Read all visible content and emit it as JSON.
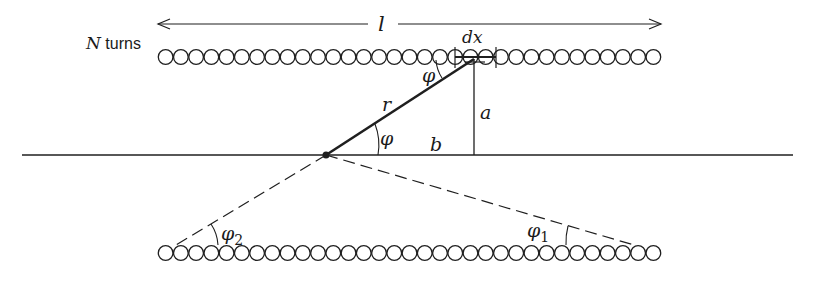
{
  "figure": {
    "labels": {
      "n_turns_symbol": "N",
      "n_turns_text": " turns",
      "length": "l",
      "element": "dx",
      "radius_vector": "r",
      "angle_top": "φ",
      "angle_center": "φ",
      "height": "a",
      "base": "b",
      "angle_left": "φ",
      "angle_left_sub": "2",
      "angle_right": "φ",
      "angle_right_sub": "1"
    },
    "solenoid": {
      "turns_per_row": 33,
      "row_top_y": 57,
      "row_bottom_y": 253,
      "x_start": 158,
      "x_end": 661
    },
    "colors": {
      "ink": "#1f1f1f",
      "background": "#ffffff"
    }
  }
}
